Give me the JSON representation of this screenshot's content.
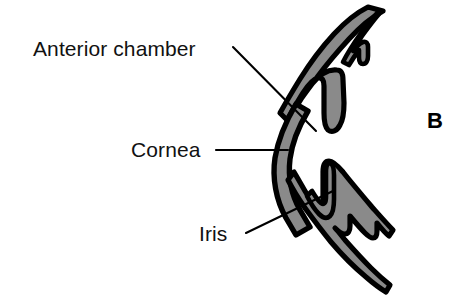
{
  "figure": {
    "type": "anatomical-diagram",
    "panel_letter": "B",
    "background_color": "#ffffff",
    "tissue_fill_color": "#8a8a8a",
    "outline_color": "#000000",
    "leader_line_color": "#000000"
  },
  "labels": {
    "anterior_chamber": "Anterior chamber",
    "cornea": "Cornea",
    "iris": "Iris"
  },
  "leader_lines": [
    {
      "name": "anterior-chamber-leader",
      "from_label": "Anterior chamber",
      "x1": 233,
      "y1": 47,
      "x2": 316,
      "y2": 131
    },
    {
      "name": "cornea-leader",
      "from_label": "Cornea",
      "x1": 216,
      "y1": 150,
      "x2": 288,
      "y2": 150
    },
    {
      "name": "iris-leader",
      "from_label": "Iris",
      "x1": 246,
      "y1": 233,
      "x2": 333,
      "y2": 191
    }
  ],
  "structures": [
    {
      "name": "cornea-arc",
      "description": "Curved gray band forming the anterior corneal dome on the left of the section"
    },
    {
      "name": "upper-iris",
      "description": "Upper iris leaf with ciliary body projecting downward into the chamber"
    },
    {
      "name": "lower-iris",
      "description": "Lower iris leaf with ciliary body projecting upward into the chamber"
    },
    {
      "name": "anterior-chamber-space",
      "description": "White space enclosed between the cornea and the iris leaves"
    }
  ]
}
